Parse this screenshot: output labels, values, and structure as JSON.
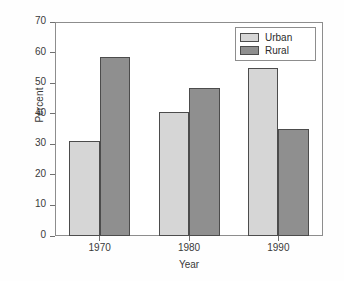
{
  "chart_data": {
    "type": "bar",
    "title": "",
    "xlabel": "Year",
    "ylabel": "Percent",
    "categories": [
      "1970",
      "1980",
      "1990"
    ],
    "series": [
      {
        "name": "Urban",
        "color": "#d6d6d6",
        "values": [
          31,
          40.5,
          55
        ]
      },
      {
        "name": "Rural",
        "color": "#8f8f8f",
        "values": [
          58.5,
          48.5,
          35
        ]
      }
    ],
    "ylim": [
      0,
      70
    ],
    "yticks": [
      0,
      10,
      20,
      30,
      40,
      50,
      60,
      70
    ],
    "ytick_labels": [
      "0",
      "10",
      "20",
      "30",
      "40",
      "50",
      "60",
      "70"
    ],
    "grid": false,
    "legend_position": "top-right",
    "legend_entries": [
      "Urban",
      "Rural"
    ]
  }
}
